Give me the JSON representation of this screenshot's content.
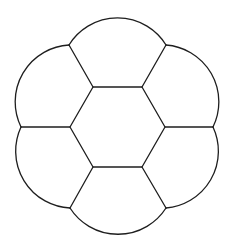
{
  "diagram": {
    "type": "hexagon-flower-tiling",
    "background": "#ffffff",
    "stroke_color": "#1e1e1e",
    "center_hexagon": {
      "vertices": [
        [
          93,
          87
        ],
        [
          142,
          87
        ],
        [
          165,
          127
        ],
        [
          142,
          167
        ],
        [
          93,
          167
        ],
        [
          70,
          127
        ]
      ]
    },
    "outer_vertices": [
      [
        69,
        45
      ],
      [
        166,
        45
      ],
      [
        213,
        127
      ],
      [
        166,
        208
      ],
      [
        70,
        208
      ],
      [
        21,
        127
      ]
    ],
    "petal_arc_radius": 57,
    "petals": [
      {
        "name": "top",
        "from": [
          69,
          45
        ],
        "to": [
          166,
          45
        ]
      },
      {
        "name": "upper-right",
        "from": [
          166,
          45
        ],
        "to": [
          213,
          127
        ]
      },
      {
        "name": "lower-right",
        "from": [
          213,
          127
        ],
        "to": [
          166,
          208
        ]
      },
      {
        "name": "bottom",
        "from": [
          166,
          208
        ],
        "to": [
          70,
          208
        ]
      },
      {
        "name": "lower-left",
        "from": [
          70,
          208
        ],
        "to": [
          21,
          127
        ]
      },
      {
        "name": "upper-left",
        "from": [
          21,
          127
        ],
        "to": [
          69,
          45
        ]
      }
    ],
    "spokes": [
      {
        "from": [
          93,
          87
        ],
        "to": [
          69,
          45
        ]
      },
      {
        "from": [
          142,
          87
        ],
        "to": [
          166,
          45
        ]
      },
      {
        "from": [
          165,
          127
        ],
        "to": [
          213,
          127
        ]
      },
      {
        "from": [
          142,
          167
        ],
        "to": [
          166,
          208
        ]
      },
      {
        "from": [
          93,
          167
        ],
        "to": [
          70,
          208
        ]
      },
      {
        "from": [
          70,
          127
        ],
        "to": [
          21,
          127
        ]
      }
    ]
  }
}
